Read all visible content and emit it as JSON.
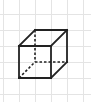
{
  "diagram": {
    "type": "cube-oblique-projection",
    "colors": {
      "background": "#ffffff",
      "grid": "#e4e4e4",
      "edge": "#222222"
    },
    "grid": {
      "spacing": 16,
      "vertical_lines_x": [
        3,
        19,
        35,
        51,
        67,
        83
      ],
      "horizontal_lines_y": [
        14,
        30,
        46,
        62,
        78,
        94
      ]
    },
    "vertices": {
      "front_top_left": [
        19,
        46
      ],
      "front_top_right": [
        51,
        46
      ],
      "front_bottom_right": [
        51,
        78
      ],
      "front_bottom_left": [
        19,
        78
      ],
      "back_top_left": [
        35,
        30
      ],
      "back_top_right": [
        67,
        30
      ],
      "back_bottom_right": [
        67,
        62
      ],
      "back_bottom_left": [
        35,
        62
      ]
    },
    "solid_edges": [
      [
        "front_top_left",
        "front_top_right"
      ],
      [
        "front_top_right",
        "front_bottom_right"
      ],
      [
        "front_bottom_right",
        "front_bottom_left"
      ],
      [
        "front_bottom_left",
        "front_top_left"
      ],
      [
        "back_top_left",
        "back_top_right"
      ],
      [
        "back_top_right",
        "back_bottom_right"
      ],
      [
        "front_top_left",
        "back_top_left"
      ],
      [
        "front_top_right",
        "back_top_right"
      ],
      [
        "front_bottom_right",
        "back_bottom_right"
      ]
    ],
    "hidden_edges": [
      [
        "back_top_left",
        "back_bottom_left"
      ],
      [
        "back_bottom_left",
        "back_bottom_right"
      ],
      [
        "front_bottom_left",
        "back_bottom_left"
      ]
    ]
  }
}
